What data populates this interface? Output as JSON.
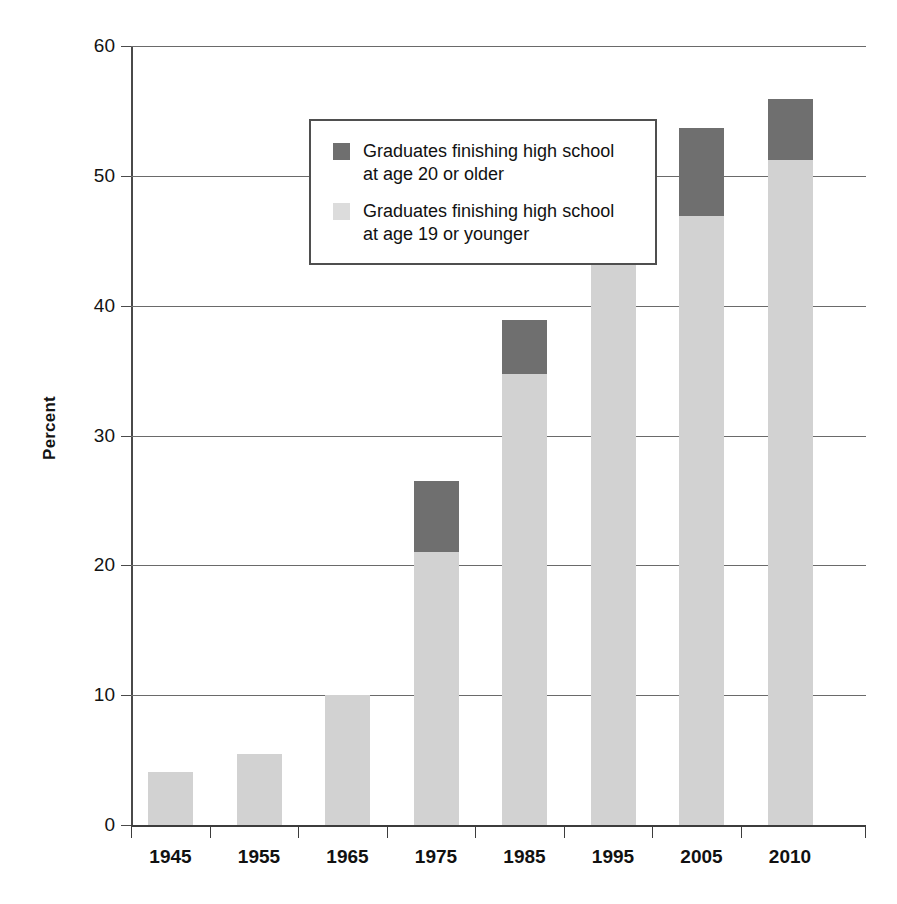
{
  "chart_data": {
    "type": "bar",
    "subtype": "stacked-vertical",
    "title": "",
    "xlabel": "",
    "ylabel": "Percent",
    "categories": [
      "1945",
      "1955",
      "1965",
      "1975",
      "1985",
      "1995",
      "2005",
      "2010"
    ],
    "series": [
      {
        "name": "Graduates finishing high school\nat age 19 or younger",
        "short_name": "age 19 or younger",
        "color": "#d2d2d2",
        "values": [
          4.1,
          5.5,
          10.0,
          21.0,
          34.7,
          45.5,
          46.9,
          51.2
        ]
      },
      {
        "name": "Graduates finishing high school\nat age 20 or older",
        "short_name": "age 20 or older",
        "color": "#6f6f6f",
        "values": [
          0.0,
          0.0,
          0.0,
          5.5,
          4.2,
          6.1,
          6.8,
          4.7
        ]
      }
    ],
    "totals": [
      4.1,
      5.5,
      10.0,
      26.5,
      38.9,
      51.6,
      53.7,
      55.9
    ],
    "ylim": [
      0,
      60
    ],
    "yticks": [
      0,
      10,
      20,
      30,
      40,
      50,
      60
    ],
    "ytick_labels": [
      "0",
      "10",
      "20",
      "30",
      "40",
      "50",
      "60"
    ],
    "grid": true,
    "grid_axis": "y",
    "legend_position": "upper-left-inside",
    "stack_order_bottom_to_top": [
      "age 19 or younger",
      "age 20 or older"
    ]
  },
  "legend": {
    "entries": [
      {
        "swatch": "dark-gray-swatch",
        "label": "Graduates finishing high school\nat age 20 or older",
        "color": "#6f6f6f"
      },
      {
        "swatch": "light-gray-swatch",
        "label": "Graduates finishing high school\nat age 19 or younger",
        "color": "#dcdcdc"
      }
    ]
  },
  "axes": {
    "y_title": "Percent",
    "y_tick_labels": [
      "60",
      "50",
      "40",
      "30",
      "20",
      "10",
      "0"
    ],
    "x_tick_labels": [
      "1945",
      "1955",
      "1965",
      "1975",
      "1985",
      "1995",
      "2005",
      "2010"
    ]
  }
}
